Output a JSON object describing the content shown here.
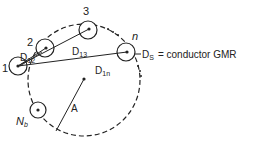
{
  "diagram": {
    "conductors": [
      {
        "id": "1",
        "label": "1"
      },
      {
        "id": "2",
        "label": "2"
      },
      {
        "id": "3",
        "label": "3"
      },
      {
        "id": "n",
        "label": "n"
      },
      {
        "id": "Nb",
        "label": "N",
        "label_sub": "b"
      }
    ],
    "distances": [
      {
        "label": "D",
        "sub": "12"
      },
      {
        "label": "D",
        "sub": "13"
      },
      {
        "label": "D",
        "sub": "1n"
      }
    ],
    "radius_label": "A",
    "gmr": {
      "label": "D",
      "sub": "S",
      "text": "= conductor GMR"
    },
    "ellipsis": "..."
  }
}
